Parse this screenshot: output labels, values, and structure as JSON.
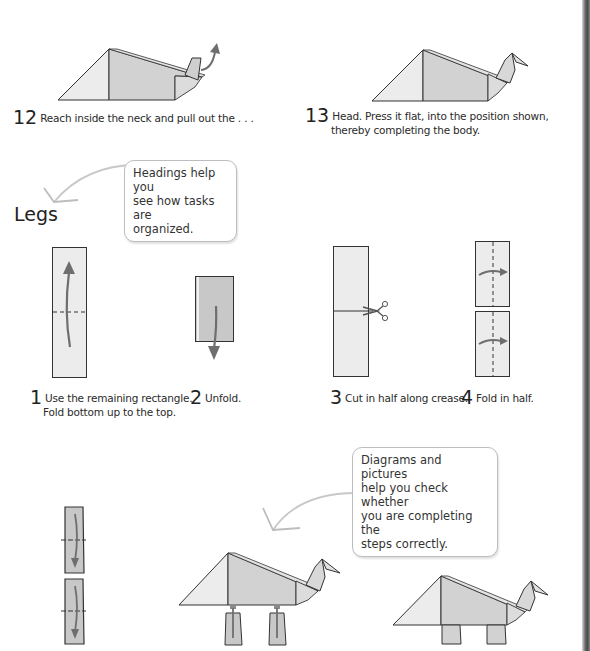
{
  "page": {
    "colors": {
      "paper_light": "#ececec",
      "paper_mid": "#d2d2d2",
      "paper_dark": "#c4c4c4",
      "outline": "#333333",
      "arrow": "#6e6e6e",
      "callout_border": "#bdbdbd",
      "spine": "#5a5a5a"
    }
  },
  "steps_top": [
    {
      "number": "12",
      "text": "Reach inside the neck and pull out the . . ."
    },
    {
      "number": "13",
      "text_line1": "Head. Press it flat, into the position shown,",
      "text_line2": "thereby completing the body."
    }
  ],
  "section": {
    "heading": "Legs"
  },
  "callouts": [
    {
      "line1": "Headings help you",
      "line2": "see how tasks are",
      "line3": "organized."
    },
    {
      "line1": "Diagrams and pictures",
      "line2": "help you check whether",
      "line3": "you are completing the",
      "line4": "steps correctly."
    }
  ],
  "legs_steps": [
    {
      "number": "1",
      "text_line1": "Use the remaining rectangle.",
      "text_line2": "Fold bottom up to the top."
    },
    {
      "number": "2",
      "text": "Unfold."
    },
    {
      "number": "3",
      "text": "Cut in half along crease."
    },
    {
      "number": "4",
      "text": "Fold in half."
    }
  ],
  "icons": {
    "scissors": "scissors-icon",
    "fold_arrow": "fold-arrow-icon",
    "pointer_arrow": "callout-pointer-icon"
  }
}
